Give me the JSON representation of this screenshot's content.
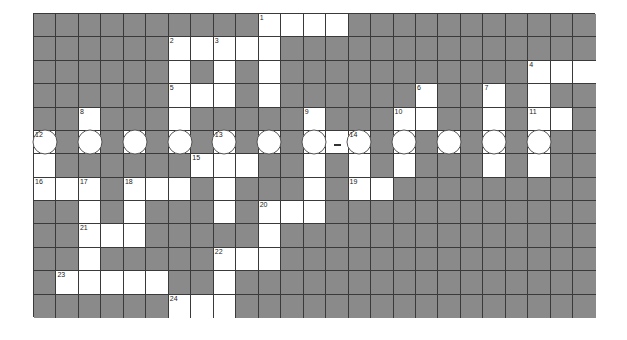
{
  "puzzle": {
    "rows": 13,
    "cols": 25,
    "colors": {
      "block": "#8a8a8a",
      "open": "#ffffff",
      "grid_line": "#3a3a3a",
      "number": "#222222"
    },
    "open_cells": [
      [
        0,
        10,
        "1"
      ],
      [
        0,
        11,
        ""
      ],
      [
        0,
        12,
        ""
      ],
      [
        0,
        13,
        ""
      ],
      [
        1,
        6,
        "2"
      ],
      [
        1,
        7,
        ""
      ],
      [
        1,
        8,
        "3"
      ],
      [
        1,
        9,
        ""
      ],
      [
        1,
        10,
        ""
      ],
      [
        2,
        6,
        ""
      ],
      [
        2,
        8,
        ""
      ],
      [
        2,
        10,
        ""
      ],
      [
        2,
        22,
        "4"
      ],
      [
        2,
        23,
        ""
      ],
      [
        2,
        24,
        ""
      ],
      [
        3,
        6,
        "5"
      ],
      [
        3,
        7,
        ""
      ],
      [
        3,
        8,
        ""
      ],
      [
        3,
        10,
        ""
      ],
      [
        3,
        17,
        "6"
      ],
      [
        3,
        20,
        "7"
      ],
      [
        3,
        22,
        ""
      ],
      [
        4,
        2,
        "8"
      ],
      [
        4,
        6,
        ""
      ],
      [
        4,
        12,
        "9"
      ],
      [
        4,
        16,
        "10"
      ],
      [
        4,
        17,
        ""
      ],
      [
        4,
        20,
        ""
      ],
      [
        4,
        22,
        "11"
      ],
      [
        4,
        23,
        ""
      ],
      [
        5,
        0,
        "12"
      ],
      [
        5,
        2,
        ""
      ],
      [
        5,
        4,
        ""
      ],
      [
        5,
        6,
        ""
      ],
      [
        5,
        8,
        "13"
      ],
      [
        5,
        10,
        ""
      ],
      [
        5,
        12,
        ""
      ],
      [
        5,
        13,
        ""
      ],
      [
        5,
        14,
        "14"
      ],
      [
        5,
        16,
        ""
      ],
      [
        5,
        18,
        ""
      ],
      [
        5,
        20,
        ""
      ],
      [
        5,
        22,
        ""
      ],
      [
        6,
        0,
        ""
      ],
      [
        6,
        7,
        "15"
      ],
      [
        6,
        8,
        ""
      ],
      [
        6,
        9,
        ""
      ],
      [
        6,
        12,
        ""
      ],
      [
        6,
        14,
        ""
      ],
      [
        6,
        16,
        ""
      ],
      [
        6,
        20,
        ""
      ],
      [
        6,
        22,
        ""
      ],
      [
        7,
        0,
        "16"
      ],
      [
        7,
        1,
        ""
      ],
      [
        7,
        2,
        "17"
      ],
      [
        7,
        4,
        "18"
      ],
      [
        7,
        5,
        ""
      ],
      [
        7,
        6,
        ""
      ],
      [
        7,
        8,
        ""
      ],
      [
        7,
        12,
        ""
      ],
      [
        7,
        14,
        "19"
      ],
      [
        7,
        15,
        ""
      ],
      [
        8,
        2,
        ""
      ],
      [
        8,
        4,
        ""
      ],
      [
        8,
        8,
        ""
      ],
      [
        8,
        10,
        "20"
      ],
      [
        8,
        11,
        ""
      ],
      [
        8,
        12,
        ""
      ],
      [
        9,
        2,
        "21"
      ],
      [
        9,
        3,
        ""
      ],
      [
        9,
        4,
        ""
      ],
      [
        9,
        10,
        ""
      ],
      [
        10,
        2,
        ""
      ],
      [
        10,
        8,
        "22"
      ],
      [
        10,
        9,
        ""
      ],
      [
        10,
        10,
        ""
      ],
      [
        11,
        1,
        "23"
      ],
      [
        11,
        2,
        ""
      ],
      [
        11,
        3,
        ""
      ],
      [
        11,
        4,
        ""
      ],
      [
        11,
        5,
        ""
      ],
      [
        11,
        8,
        ""
      ],
      [
        12,
        6,
        "24"
      ],
      [
        12,
        7,
        ""
      ],
      [
        12,
        8,
        ""
      ]
    ],
    "circled_cells": [
      [
        5,
        0
      ],
      [
        5,
        2
      ],
      [
        5,
        4
      ],
      [
        5,
        6
      ],
      [
        5,
        8
      ],
      [
        5,
        10
      ],
      [
        5,
        12
      ],
      [
        5,
        14
      ],
      [
        5,
        16
      ],
      [
        5,
        18
      ],
      [
        5,
        20
      ],
      [
        5,
        22
      ]
    ],
    "dash_cells": [
      [
        5,
        13
      ]
    ],
    "clue_numbers": [
      "1",
      "2",
      "3",
      "4",
      "5",
      "6",
      "7",
      "8",
      "9",
      "10",
      "11",
      "12",
      "13",
      "14",
      "15",
      "16",
      "17",
      "18",
      "19",
      "20",
      "21",
      "22",
      "23",
      "24"
    ]
  }
}
